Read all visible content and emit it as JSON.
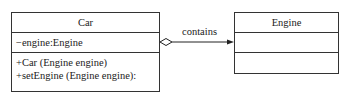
{
  "classes": {
    "car": {
      "name": "Car",
      "attributes": [
        "−engine:Engine"
      ],
      "operations": [
        "+Car (Engine engine)",
        "+setEngine (Engine engine):"
      ]
    },
    "engine": {
      "name": "Engine",
      "attributes": [],
      "operations": []
    }
  },
  "relation": {
    "type": "aggregation",
    "label": "contains",
    "from": "Car",
    "to": "Engine"
  }
}
